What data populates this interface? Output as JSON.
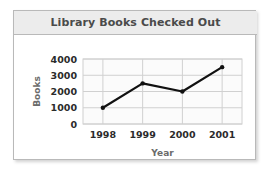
{
  "card": {
    "title": "Library Books Checked Out"
  },
  "chart_data": {
    "type": "line",
    "title": "Library Books Checked Out",
    "xlabel": "Year",
    "ylabel": "Books",
    "categories": [
      "1998",
      "1999",
      "2000",
      "2001"
    ],
    "values": [
      1000,
      2500,
      2000,
      3500
    ],
    "x": [
      1998,
      1999,
      2000,
      2001
    ],
    "ytick_labels": [
      "0",
      "1000",
      "2000",
      "3000",
      "4000"
    ],
    "yticks": [
      0,
      1000,
      2000,
      3000,
      4000
    ],
    "ylim": [
      0,
      4000
    ],
    "grid": true,
    "legend": "none",
    "series": [
      {
        "name": "Books checked out",
        "values": [
          1000,
          2500,
          2000,
          3500
        ],
        "color": "#111111",
        "marker": "circle"
      }
    ],
    "colors": {
      "line": "#111111",
      "marker": "#111111",
      "grid": "#d0d0d0",
      "plot_background": "#fbfbfb",
      "axis_text": "#2b2b2b",
      "axis_title": "#6b6b6b",
      "title_text": "#4a4a4a",
      "title_background": "#ececec",
      "card_border": "#b9b9b9"
    }
  }
}
